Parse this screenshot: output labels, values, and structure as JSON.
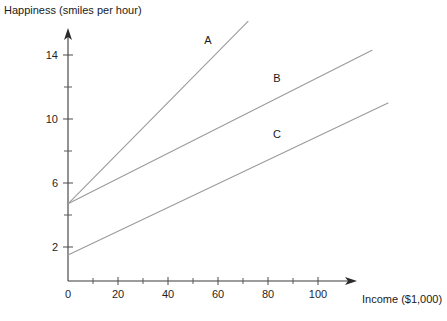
{
  "chart_data": {
    "type": "line",
    "title": "",
    "ylabel": "Happiness (smiles per hour)",
    "xlabel": "Income ($1,000)",
    "xlim": [
      0,
      112
    ],
    "ylim": [
      0.5,
      16.5
    ],
    "grid": false,
    "legend": "inline-labels",
    "x_ticks_major": [
      0,
      20,
      40,
      60,
      80,
      100
    ],
    "x_tick_labels": [
      "0",
      "20",
      "40",
      "60",
      "80",
      "100"
    ],
    "x_ticks_minor": [
      10,
      30,
      50,
      70,
      90
    ],
    "y_ticks_major": [
      2,
      6,
      10,
      14
    ],
    "y_tick_labels": [
      "2",
      "6",
      "10",
      "14"
    ],
    "y_ticks_minor": [
      4,
      8,
      12
    ],
    "series": [
      {
        "name": "A",
        "label": "A",
        "intercept": 4.7,
        "slope": 0.158,
        "x": [
          0,
          72
        ],
        "values": [
          4.7,
          16.1
        ],
        "label_x": 56,
        "label_y": 14.7
      },
      {
        "name": "B",
        "label": "B",
        "intercept": 4.7,
        "slope": 0.079,
        "x": [
          0,
          121.6
        ],
        "values": [
          4.7,
          14.3
        ],
        "label_x": 83.6,
        "label_y": 12.3
      },
      {
        "name": "C",
        "label": "C",
        "intercept": 1.5,
        "slope": 0.0742,
        "x": [
          0,
          128
        ],
        "values": [
          1.5,
          11.0
        ],
        "label_x": 83.6,
        "label_y": 8.8
      }
    ]
  },
  "axes": {
    "y_axis_title": "Happiness (smiles per hour)",
    "x_axis_title": "Income ($1,000)"
  },
  "labels": {
    "series_a": "A",
    "series_b": "B",
    "series_c": "C"
  },
  "colors": {
    "axis": "#3a3a3a",
    "series": "#9a9a9a",
    "text": "#1a1a1a",
    "background": "#ffffff"
  }
}
